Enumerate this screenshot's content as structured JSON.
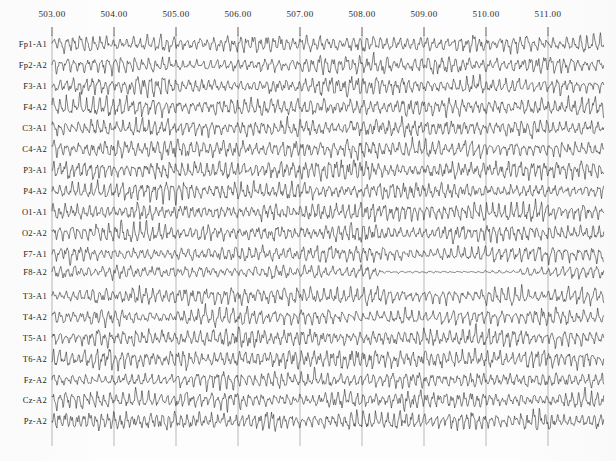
{
  "chart_data": {
    "type": "line",
    "title": "",
    "subtitle": "",
    "xlabel": "",
    "ylabel": "",
    "grid": true,
    "legend_position": "none",
    "x_axis": {
      "label_position": "top",
      "unit": "seconds",
      "min": 502.88,
      "max": 511.9,
      "tick_labels": [
        "503.00",
        "504.00",
        "505.00",
        "506.00",
        "507.00",
        "508.00",
        "509.00",
        "510.00",
        "511.00"
      ],
      "tick_values": [
        503,
        504,
        505,
        506,
        507,
        508,
        509,
        510,
        511
      ],
      "tick_pixels": [
        52,
        114,
        176,
        238,
        300,
        362,
        424,
        486,
        548
      ]
    },
    "plot_area": {
      "left": 50,
      "right": 604,
      "top": 34,
      "bottom": 446
    },
    "channel_spacing_px": 21.1,
    "first_channel_y_px": 44,
    "series": [
      {
        "name": "Fp1-A1",
        "label": "Fp1-A1",
        "baseline": 44,
        "amp": 9.0,
        "freq": 9.3,
        "seed": 11,
        "noise": 0.42,
        "flat_from": null
      },
      {
        "name": "Fp2-A2",
        "label": "Fp2-A2",
        "baseline": 65,
        "amp": 8.6,
        "freq": 9.1,
        "seed": 27,
        "noise": 0.44,
        "flat_from": null
      },
      {
        "name": "F3-A1",
        "label": "F3-A1",
        "baseline": 86,
        "amp": 9.2,
        "freq": 9.6,
        "seed": 43,
        "noise": 0.4,
        "flat_from": null
      },
      {
        "name": "F4-A2",
        "label": "F4-A2",
        "baseline": 107,
        "amp": 9.0,
        "freq": 9.4,
        "seed": 59,
        "noise": 0.43,
        "flat_from": null
      },
      {
        "name": "C3-A1",
        "label": "C3-A1",
        "baseline": 128,
        "amp": 8.8,
        "freq": 9.8,
        "seed": 71,
        "noise": 0.41,
        "flat_from": null
      },
      {
        "name": "C4-A2",
        "label": "C4-A2",
        "baseline": 149,
        "amp": 9.1,
        "freq": 9.5,
        "seed": 89,
        "noise": 0.45,
        "flat_from": null
      },
      {
        "name": "P3-A1",
        "label": "P3-A1",
        "baseline": 170,
        "amp": 9.4,
        "freq": 10.1,
        "seed": 103,
        "noise": 0.4,
        "flat_from": null
      },
      {
        "name": "P4-A2",
        "label": "P4-A2",
        "baseline": 191,
        "amp": 9.2,
        "freq": 9.9,
        "seed": 117,
        "noise": 0.42,
        "flat_from": null
      },
      {
        "name": "O1-A1",
        "label": "O1-A1",
        "baseline": 212,
        "amp": 9.6,
        "freq": 10.3,
        "seed": 131,
        "noise": 0.38,
        "flat_from": null
      },
      {
        "name": "O2-A2",
        "label": "O2-A2",
        "baseline": 233,
        "amp": 9.3,
        "freq": 10.0,
        "seed": 149,
        "noise": 0.41,
        "flat_from": null
      },
      {
        "name": "F7-A1",
        "label": "F7-A1",
        "baseline": 254,
        "amp": 8.2,
        "freq": 9.2,
        "seed": 163,
        "noise": 0.44,
        "flat_from": null
      },
      {
        "name": "F8-A2",
        "label": "F8-A2",
        "baseline": 272,
        "amp": 7.4,
        "freq": 8.9,
        "seed": 179,
        "noise": 0.4,
        "flat_from": 0.57
      },
      {
        "name": "T3-A1",
        "label": "T3-A1",
        "baseline": 296,
        "amp": 8.8,
        "freq": 9.4,
        "seed": 193,
        "noise": 0.45,
        "flat_from": null
      },
      {
        "name": "T4-A2",
        "label": "T4-A2",
        "baseline": 317,
        "amp": 8.6,
        "freq": 9.0,
        "seed": 211,
        "noise": 0.43,
        "flat_from": null
      },
      {
        "name": "T5-A1",
        "label": "T5-A1",
        "baseline": 338,
        "amp": 9.0,
        "freq": 9.7,
        "seed": 227,
        "noise": 0.41,
        "flat_from": null
      },
      {
        "name": "T6-A2",
        "label": "T6-A2",
        "baseline": 359,
        "amp": 9.3,
        "freq": 10.0,
        "seed": 241,
        "noise": 0.39,
        "flat_from": null
      },
      {
        "name": "Fz-A2",
        "label": "Fz-A2",
        "baseline": 380,
        "amp": 8.9,
        "freq": 9.5,
        "seed": 257,
        "noise": 0.43,
        "flat_from": null
      },
      {
        "name": "Cz-A2",
        "label": "Cz-A2",
        "baseline": 400,
        "amp": 9.4,
        "freq": 9.8,
        "seed": 271,
        "noise": 0.42,
        "flat_from": null
      },
      {
        "name": "Pz-A2",
        "label": "Pz-A2",
        "baseline": 421,
        "amp": 10.2,
        "freq": 10.2,
        "seed": 283,
        "noise": 0.4,
        "flat_from": null
      }
    ]
  },
  "chart": {
    "channel_count": 19,
    "montage": "referential",
    "colors": {
      "background": "#fdfdfd",
      "trace": "#333333",
      "grid": "#4a4a4a",
      "text": "#242424"
    }
  }
}
